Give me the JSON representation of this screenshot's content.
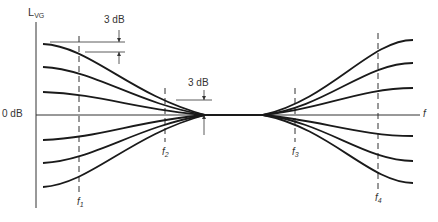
{
  "diagram": {
    "y_axis_label": "L",
    "y_axis_label_sub": "VG",
    "x_axis_label": "f",
    "zero_label": "0 dB",
    "annotations": [
      {
        "text": "3 dB",
        "position": "upper-left"
      },
      {
        "text": "3 dB",
        "position": "center"
      }
    ],
    "frequency_markers": [
      {
        "label": "f",
        "sub": "1"
      },
      {
        "label": "f",
        "sub": "2"
      },
      {
        "label": "f",
        "sub": "3"
      },
      {
        "label": "f",
        "sub": "4"
      }
    ],
    "colors": {
      "line": "#1a1a1a",
      "text": "#333333",
      "background": "#ffffff"
    }
  }
}
